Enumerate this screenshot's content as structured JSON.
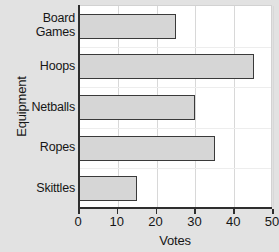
{
  "chart_data": {
    "type": "bar",
    "orientation": "horizontal",
    "title": "",
    "xlabel": "Votes",
    "ylabel": "Equipment",
    "categories": [
      "Board Games",
      "Hoops",
      "Netballs",
      "Ropes",
      "Skittles"
    ],
    "category_lines": [
      [
        "Board",
        "Games"
      ],
      [
        "Hoops"
      ],
      [
        "Netballs"
      ],
      [
        "Ropes"
      ],
      [
        "Skittles"
      ]
    ],
    "values": [
      25,
      45,
      30,
      35,
      15
    ],
    "xlim": [
      0,
      50
    ],
    "xticks": [
      0,
      10,
      20,
      30,
      40,
      50
    ],
    "xtick_labels": [
      "0",
      "10",
      "20",
      "30",
      "40",
      "50"
    ],
    "grid": true,
    "legend": false,
    "bar_fill_color": "#d6d6d6",
    "bar_edge_color": "#3a3a3a",
    "plot_background_color": "#ffffff",
    "page_background_color": "#e2e2e2"
  }
}
